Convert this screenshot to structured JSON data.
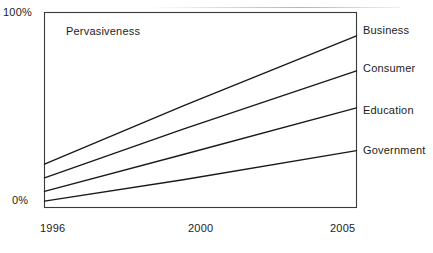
{
  "chart_data": {
    "type": "line",
    "title": "",
    "subtitle": "",
    "xlabel": "",
    "ylabel": "",
    "annotation": "Pervasiveness",
    "x": [
      1996,
      2000,
      2005
    ],
    "xtick_labels": [
      "1996",
      "2000",
      "2005"
    ],
    "ytick_labels": [
      "0%",
      "100%"
    ],
    "xlim": [
      1996,
      2005
    ],
    "ylim": [
      0,
      100
    ],
    "grid": false,
    "legend_position": "right-inline-end-labels",
    "series": [
      {
        "name": "Business",
        "label": "Business",
        "values": [
          22,
          52,
          88
        ],
        "start_value": 22,
        "end_value": 88,
        "color": "#1a1a1a"
      },
      {
        "name": "Consumer",
        "label": "Consumer",
        "values": [
          15,
          40,
          70
        ],
        "start_value": 15,
        "end_value": 70,
        "color": "#1a1a1a"
      },
      {
        "name": "Education",
        "label": "Education",
        "values": [
          8,
          27,
          51
        ],
        "start_value": 8,
        "end_value": 51,
        "color": "#1a1a1a"
      },
      {
        "name": "Government",
        "label": "Government",
        "values": [
          3,
          14,
          29
        ],
        "start_value": 3,
        "end_value": 29,
        "color": "#1a1a1a"
      }
    ]
  },
  "axes": {
    "y_top_label": "100%",
    "y_bottom_label": "0%",
    "x_labels": [
      "1996",
      "2000",
      "2005"
    ],
    "frame_color": "#3a3a3a"
  },
  "colors": {
    "background": "#ffffff",
    "ink": "#1a1a1a",
    "frame": "#3a3a3a"
  }
}
